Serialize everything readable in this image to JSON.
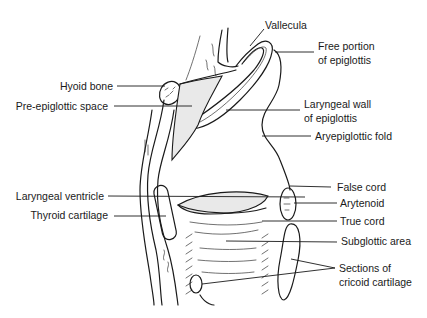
{
  "figure": {
    "colors": {
      "ink": "#1a1a1a",
      "background": "#ffffff"
    },
    "labels": {
      "vallecula": {
        "lines": [
          "Vallecula"
        ]
      },
      "free_epiglottis": {
        "lines": [
          "Free portion",
          "of epiglottis"
        ]
      },
      "hyoid_bone": {
        "lines": [
          "Hyoid bone"
        ]
      },
      "pre_epiglottic": {
        "lines": [
          "Pre-epiglottic space"
        ]
      },
      "laryngeal_wall": {
        "lines": [
          "Laryngeal wall",
          "of epiglottis"
        ]
      },
      "aryepiglottic": {
        "lines": [
          "Aryepiglottic fold"
        ]
      },
      "laryngeal_ventricle": {
        "lines": [
          "Laryngeal ventricle"
        ]
      },
      "thyroid_cartilage": {
        "lines": [
          "Thyroid cartilage"
        ]
      },
      "false_cord": {
        "lines": [
          "False cord"
        ]
      },
      "arytenoid": {
        "lines": [
          "Arytenoid"
        ]
      },
      "true_cord": {
        "lines": [
          "True cord"
        ]
      },
      "subglottic": {
        "lines": [
          "Subglottic area"
        ]
      },
      "cricoid": {
        "lines": [
          "Sections of",
          "cricoid cartilage"
        ]
      }
    }
  }
}
